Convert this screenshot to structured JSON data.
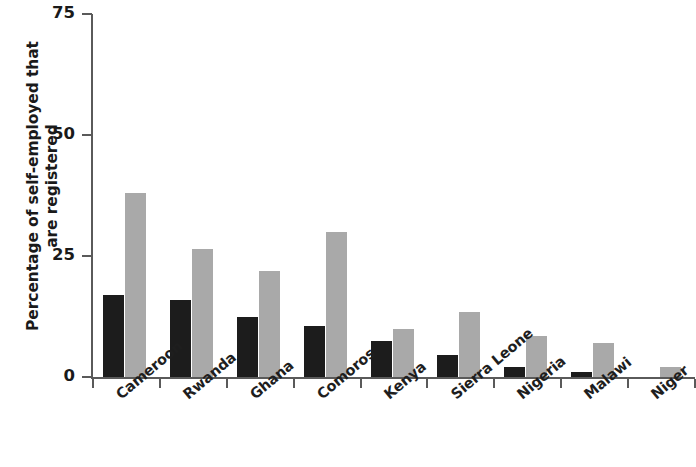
{
  "chart_data": {
    "type": "bar",
    "title": "",
    "subtitle": "",
    "xlabel": "",
    "ylabel": "Percentage of self-employed that are registered",
    "ylabel_line1": "Percentage of self-employed that",
    "ylabel_line2": "are registered",
    "ylim": [
      0,
      75
    ],
    "yticks": [
      0,
      25,
      50,
      75
    ],
    "ytick_labels": [
      "0",
      "25",
      "50",
      "75"
    ],
    "grid": false,
    "legend": false,
    "legend_position": "none",
    "orientation": "vertical",
    "categories": [
      "Cameroon",
      "Rwanda",
      "Ghana",
      "Comoros",
      "Kenya",
      "Sierra Leone",
      "Nigeria",
      "Malawi",
      "Niger"
    ],
    "series": [
      {
        "name": "series-1",
        "color": "#1c1c1c",
        "values": [
          17,
          16,
          12.5,
          10.5,
          7.5,
          4.5,
          2,
          1,
          0
        ]
      },
      {
        "name": "series-2",
        "color": "#a9a9a9",
        "values": [
          38,
          26.5,
          22,
          30,
          10,
          13.5,
          8.5,
          7,
          2
        ]
      }
    ],
    "colors": {
      "series_1": "#1c1c1c",
      "series_2": "#a9a9a9",
      "axis": "#5a5a5a",
      "text": "#1a1a1a",
      "background": "#ffffff"
    }
  }
}
